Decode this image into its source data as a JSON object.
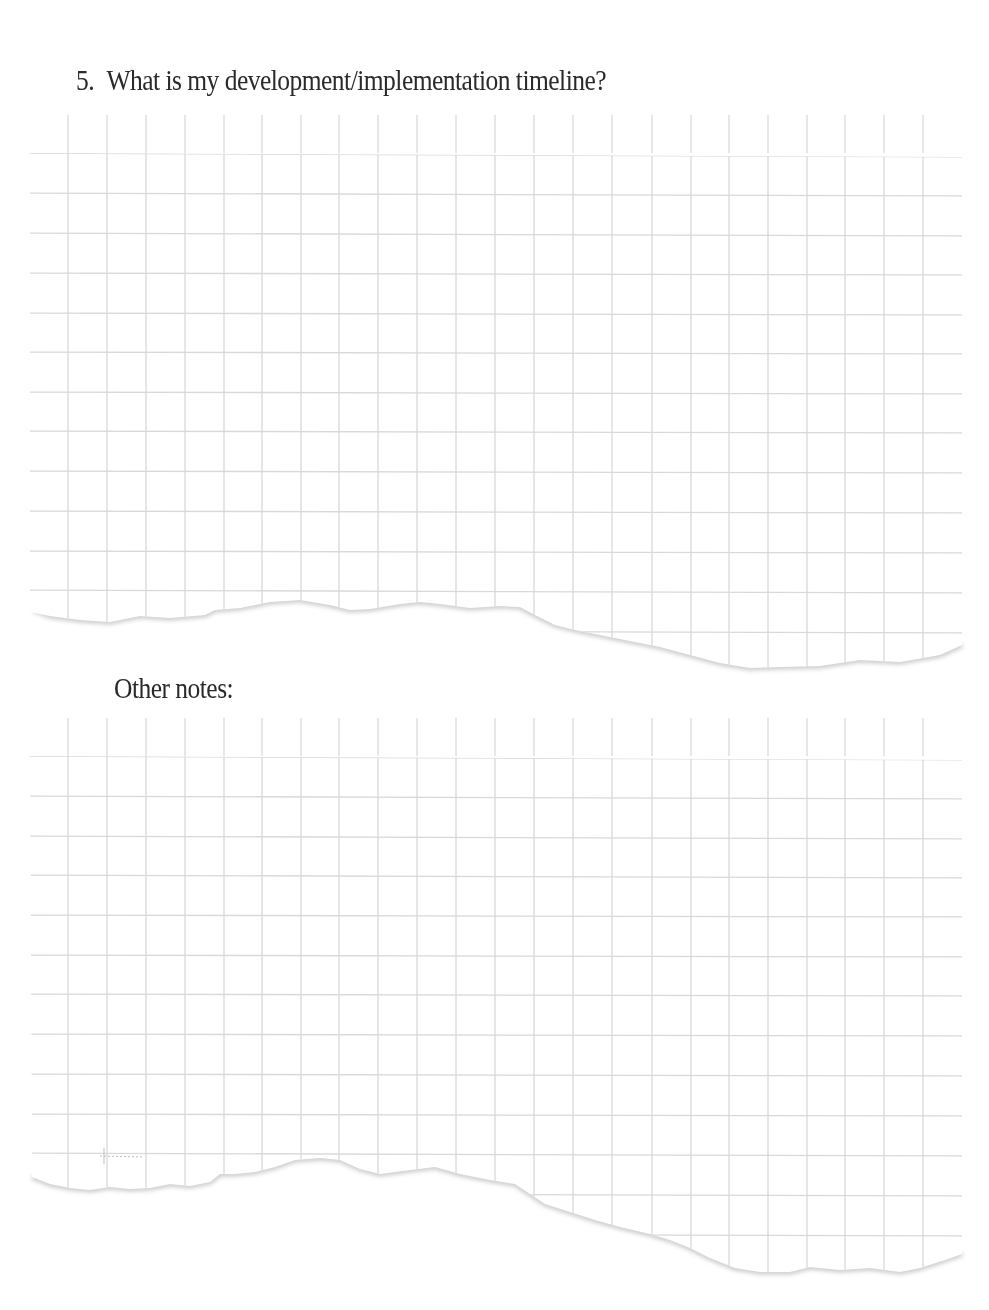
{
  "questions": [
    {
      "number": "5.",
      "text": "What is my development/implementation timeline?"
    }
  ],
  "notes": {
    "label": "Other notes:"
  },
  "sheets": [
    {
      "name": "timeline-answer-sheet",
      "content": ""
    },
    {
      "name": "other-notes-sheet",
      "content": ""
    }
  ],
  "colors": {
    "grid_line": "#d9d9d9",
    "text": "#2a2a2a",
    "paper": "#ffffff",
    "tear_shadow": "#cfcfcf"
  }
}
